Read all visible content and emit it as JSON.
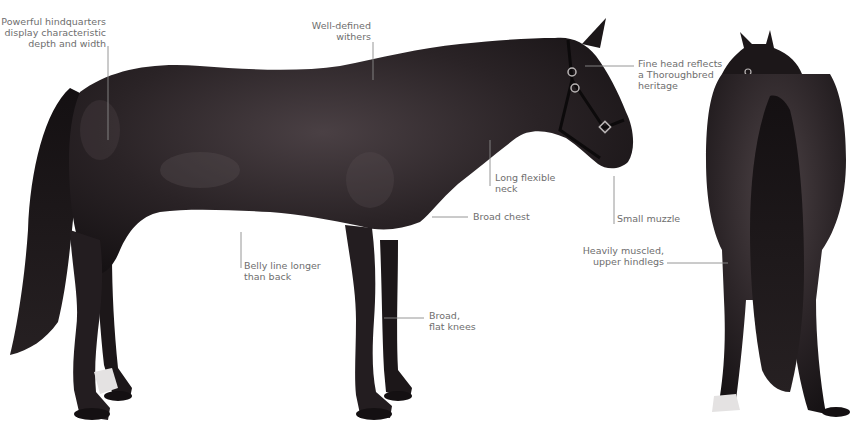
{
  "figure": {
    "colors": {
      "background": "#ffffff",
      "label_text": "#6e6e6e",
      "leader_line": "#8a8a8a",
      "coat": "#2a2326",
      "coat_dark": "#141012",
      "coat_highlight": "#5a4f52",
      "white_marking": "#e4e2e2"
    },
    "views": [
      {
        "id": "side-view",
        "description": "Bay horse in profile facing right wearing a halter"
      },
      {
        "id": "rear-view",
        "description": "Same horse viewed from behind with long tail"
      }
    ]
  },
  "annotations": [
    {
      "id": "hindquarters",
      "text": "Powerful hindquarters\ndisplay characteristic\ndepth and width"
    },
    {
      "id": "withers",
      "text": "Well-defined\nwithers"
    },
    {
      "id": "head",
      "text": "Fine head reflects\na Thoroughbred\nheritage"
    },
    {
      "id": "neck",
      "text": "Long flexible\nneck"
    },
    {
      "id": "chest",
      "text": "Broad chest"
    },
    {
      "id": "muzzle",
      "text": "Small muzzle"
    },
    {
      "id": "belly",
      "text": "Belly line longer\nthan back"
    },
    {
      "id": "knees",
      "text": "Broad,\nflat knees"
    },
    {
      "id": "hindlegs",
      "text": "Heavily muscled,\nupper hindlegs"
    }
  ]
}
